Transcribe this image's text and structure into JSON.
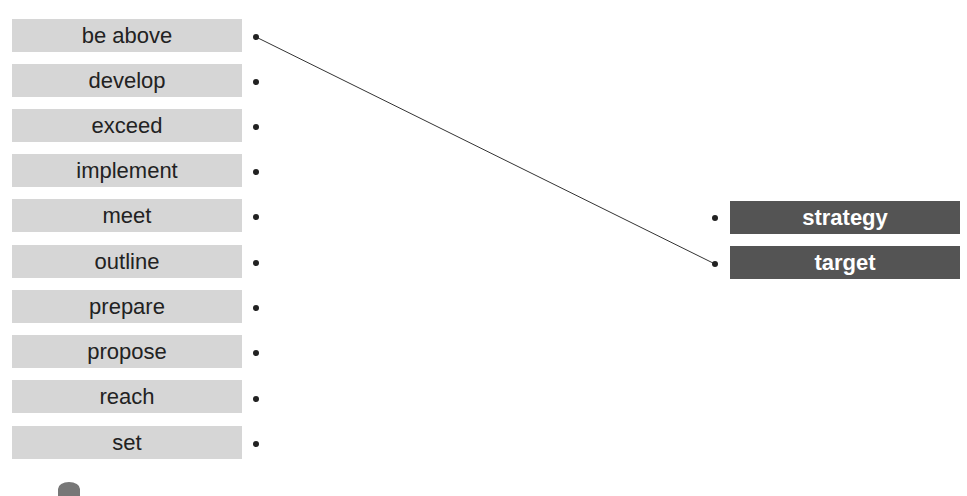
{
  "left_column": {
    "items": [
      {
        "label": "be above",
        "connected_to": "target"
      },
      {
        "label": "develop",
        "connected_to": null
      },
      {
        "label": "exceed",
        "connected_to": null
      },
      {
        "label": "implement",
        "connected_to": null
      },
      {
        "label": "meet",
        "connected_to": null
      },
      {
        "label": "outline",
        "connected_to": null
      },
      {
        "label": "prepare",
        "connected_to": null
      },
      {
        "label": "propose",
        "connected_to": null
      },
      {
        "label": "reach",
        "connected_to": null
      },
      {
        "label": "set",
        "connected_to": null
      }
    ]
  },
  "right_column": {
    "items": [
      {
        "label": "strategy"
      },
      {
        "label": "target"
      }
    ]
  },
  "connections": [
    {
      "from": "be above",
      "to": "target"
    }
  ],
  "colors": {
    "left_box": "#d6d6d6",
    "right_box": "#545454",
    "line": "#333333"
  }
}
